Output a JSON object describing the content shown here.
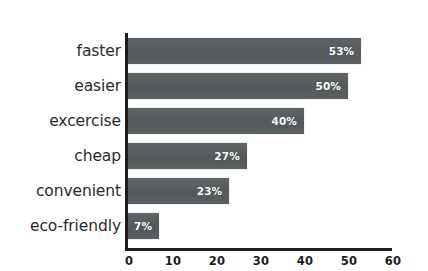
{
  "chart_data": {
    "type": "bar",
    "orientation": "horizontal",
    "title": "",
    "subtitle": "",
    "xlabel": "",
    "ylabel": "",
    "xlim": [
      0,
      60
    ],
    "grid": false,
    "legend": false,
    "legend_position": "none",
    "xticks": [
      "0",
      "10",
      "20",
      "30",
      "40",
      "50",
      "60"
    ],
    "xtick_values": [
      0,
      10,
      20,
      30,
      40,
      50,
      60
    ],
    "categories": [
      "faster",
      "easier",
      "excercise",
      "cheap",
      "convenient",
      "eco-friendly"
    ],
    "values": [
      53,
      50,
      40,
      27,
      23,
      7
    ],
    "data_labels": [
      "53%",
      "50%",
      "40%",
      "27%",
      "23%",
      "7%"
    ],
    "bars": [
      {
        "category": "faster",
        "value": 53,
        "label": "53%"
      },
      {
        "category": "easier",
        "value": 50,
        "label": "50%"
      },
      {
        "category": "excercise",
        "value": 40,
        "label": "40%"
      },
      {
        "category": "cheap",
        "value": 27,
        "label": "27%"
      },
      {
        "category": "convenient",
        "value": 23,
        "label": "23%"
      },
      {
        "category": "eco-friendly",
        "value": 7,
        "label": "7%"
      }
    ],
    "colors": {
      "bar": "#5b6063",
      "axis": "#1d1d1d",
      "background": "#ffffff",
      "data_label": "#ffffff",
      "category_label": "#2b2b2b",
      "tick_label": "#1d1d1d"
    }
  }
}
